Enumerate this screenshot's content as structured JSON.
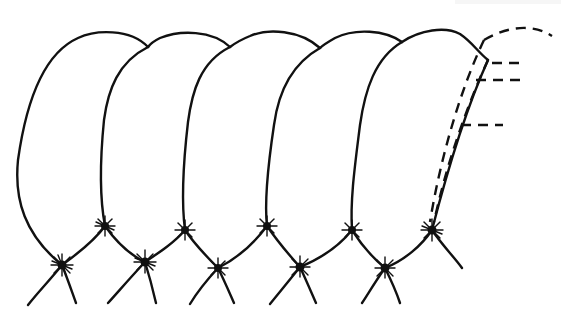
{
  "diagram": {
    "type": "line-art",
    "segment_count": 5,
    "colors": {
      "stroke": "#111111",
      "background": "#ffffff"
    },
    "segments": [
      {
        "id": 1,
        "label": ""
      },
      {
        "id": 2,
        "label": ""
      },
      {
        "id": 3,
        "label": ""
      },
      {
        "id": 4,
        "label": ""
      },
      {
        "id": 5,
        "label": "",
        "has_dashed_layers": true
      }
    ],
    "junction_markers": 10,
    "leader_lines": 3,
    "labels": []
  }
}
